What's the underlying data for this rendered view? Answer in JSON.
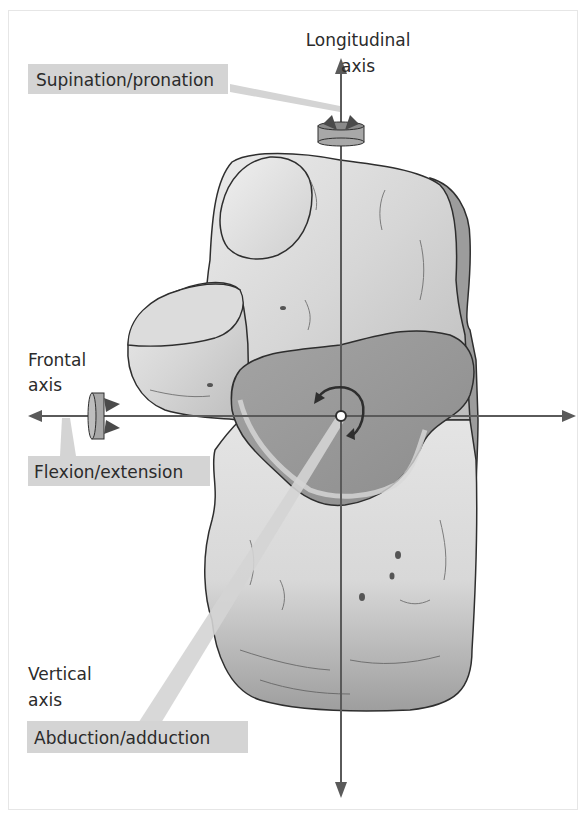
{
  "figure": {
    "axes": {
      "longitudinal": {
        "label_line1": "Longitudinal",
        "label_line2": "axis",
        "motion": "Supination/pronation"
      },
      "frontal": {
        "label_line1": "Frontal",
        "label_line2": "axis",
        "motion": "Flexion/extension"
      },
      "vertical": {
        "label_line1": "Vertical",
        "label_line2": "axis",
        "motion": "Abduction/adduction"
      }
    },
    "colors": {
      "axis_line": "#5a5a5a",
      "label_box": "#d4d4d4",
      "bone_light": "#e2e2e2",
      "bone_mid": "#c6c6c6",
      "bone_dark": "#8f8f8f",
      "articular_surface": "#9a9a9a",
      "outline": "#2e2e2e",
      "rotation_marker": "#8a8a8a"
    }
  }
}
